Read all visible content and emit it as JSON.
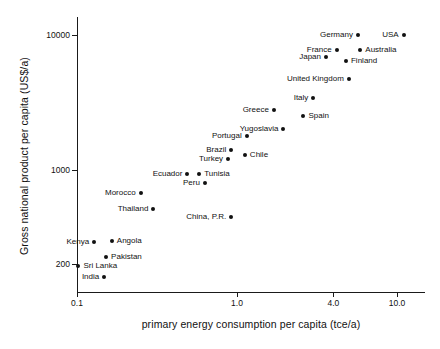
{
  "chart_data": {
    "type": "scatter",
    "title": "",
    "xlabel": "primary energy consumption per capita (tce/a)",
    "ylabel": "Gross national product per capita (US$/a)",
    "xscale": "log",
    "yscale": "log",
    "xlim": [
      0.1,
      13.0
    ],
    "ylim": [
      150,
      13000
    ],
    "grid": false,
    "legend": "none",
    "xticks": [
      {
        "value": 0.1,
        "label": "0.1"
      },
      {
        "value": 1.0,
        "label": "1.0"
      },
      {
        "value": 4.0,
        "label": "4.0"
      },
      {
        "value": 10.0,
        "label": "10.0"
      }
    ],
    "yticks": [
      {
        "value": 10000,
        "label": "10000"
      },
      {
        "value": 1000,
        "label": "1000"
      },
      {
        "value": 200,
        "label": "200"
      }
    ],
    "points": [
      {
        "label": "USA",
        "x": 11.0,
        "y": 10000,
        "label_side": "left"
      },
      {
        "label": "Germany",
        "x": 5.7,
        "y": 10000,
        "label_side": "left"
      },
      {
        "label": "Australia",
        "x": 5.9,
        "y": 7800,
        "label_side": "right"
      },
      {
        "label": "France",
        "x": 4.2,
        "y": 7800,
        "label_side": "left"
      },
      {
        "label": "Japan",
        "x": 3.6,
        "y": 6900,
        "label_side": "left"
      },
      {
        "label": "Finland",
        "x": 4.8,
        "y": 6400,
        "label_side": "right"
      },
      {
        "label": "United Kingdom",
        "x": 5.0,
        "y": 4700,
        "label_side": "left"
      },
      {
        "label": "Italy",
        "x": 3.0,
        "y": 3400,
        "label_side": "left"
      },
      {
        "label": "Greece",
        "x": 1.7,
        "y": 2800,
        "label_side": "left"
      },
      {
        "label": "Spain",
        "x": 2.6,
        "y": 2500,
        "label_side": "right"
      },
      {
        "label": "Yugoslavia",
        "x": 1.95,
        "y": 2000,
        "label_side": "left"
      },
      {
        "label": "Portugal",
        "x": 1.15,
        "y": 1800,
        "label_side": "left"
      },
      {
        "label": "Brazil",
        "x": 0.92,
        "y": 1400,
        "label_side": "left"
      },
      {
        "label": "Chile",
        "x": 1.12,
        "y": 1300,
        "label_side": "right"
      },
      {
        "label": "Turkey",
        "x": 0.88,
        "y": 1200,
        "label_side": "left"
      },
      {
        "label": "Tunisia",
        "x": 0.58,
        "y": 930,
        "label_side": "right"
      },
      {
        "label": "Ecuador",
        "x": 0.49,
        "y": 930,
        "label_side": "left"
      },
      {
        "label": "Peru",
        "x": 0.63,
        "y": 800,
        "label_side": "left"
      },
      {
        "label": "Morocco",
        "x": 0.25,
        "y": 680,
        "label_side": "left"
      },
      {
        "label": "Thailand",
        "x": 0.3,
        "y": 510,
        "label_side": "left"
      },
      {
        "label": "China, P.R.",
        "x": 0.92,
        "y": 450,
        "label_side": "left"
      },
      {
        "label": "Angola",
        "x": 0.165,
        "y": 300,
        "label_side": "right"
      },
      {
        "label": "Kenya",
        "x": 0.128,
        "y": 295,
        "label_side": "left"
      },
      {
        "label": "Pakistan",
        "x": 0.152,
        "y": 225,
        "label_side": "right"
      },
      {
        "label": "Sri Lanka",
        "x": 0.102,
        "y": 195,
        "label_side": "right"
      },
      {
        "label": "India",
        "x": 0.148,
        "y": 160,
        "label_side": "left"
      }
    ]
  }
}
